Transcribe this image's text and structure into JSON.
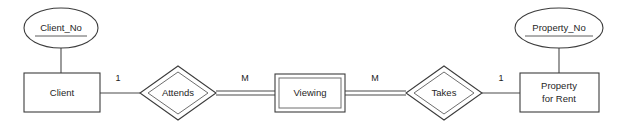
{
  "diagram": {
    "notation": "chen",
    "stroke_color": "#3c3c3c",
    "inner_stroke_color": "#6e6e6e",
    "background_color": "#ffffff",
    "entities": [
      {
        "id": "client",
        "label": "Client",
        "kind": "strong-entity"
      },
      {
        "id": "viewing",
        "label": "Viewing",
        "kind": "weak-entity"
      },
      {
        "id": "property_for_rent",
        "label_line1": "Property",
        "label_line2": "for Rent",
        "kind": "strong-entity"
      }
    ],
    "relationships": [
      {
        "id": "attends",
        "label": "Attends",
        "kind": "identifying-relationship"
      },
      {
        "id": "takes",
        "label": "Takes",
        "kind": "identifying-relationship"
      }
    ],
    "attributes": [
      {
        "id": "client_no",
        "label": "Client_No",
        "kind": "key-attribute",
        "owner": "client",
        "underlined": true
      },
      {
        "id": "property_no",
        "label": "Property_No",
        "kind": "key-attribute",
        "owner": "property_for_rent",
        "underlined": true
      }
    ],
    "cardinalities": [
      {
        "id": "client_attends",
        "label": "1",
        "from": "client",
        "to": "attends"
      },
      {
        "id": "attends_viewing",
        "label": "M",
        "from": "attends",
        "to": "viewing"
      },
      {
        "id": "viewing_takes",
        "label": "M",
        "from": "viewing",
        "to": "takes"
      },
      {
        "id": "takes_property",
        "label": "1",
        "from": "takes",
        "to": "property_for_rent"
      }
    ]
  }
}
